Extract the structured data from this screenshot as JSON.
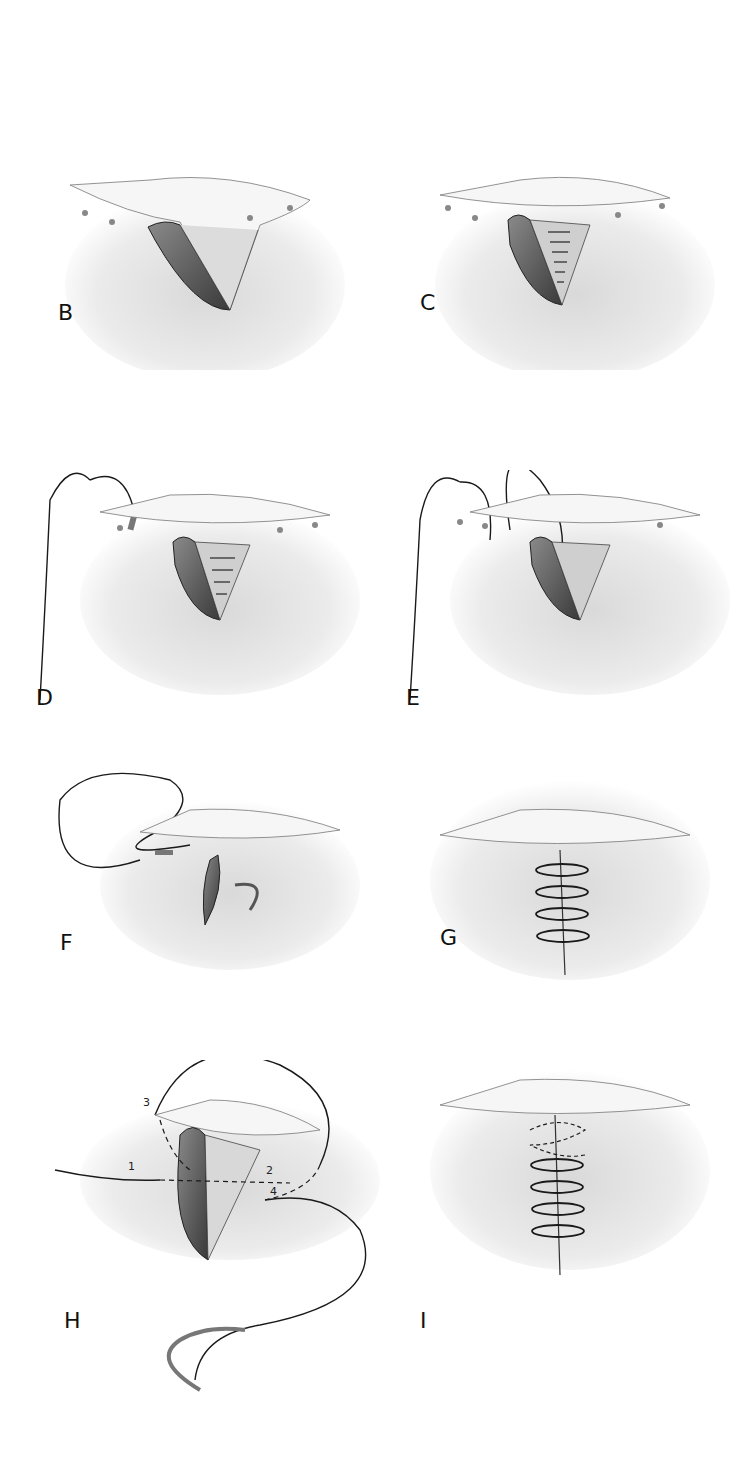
{
  "figure": {
    "panels": [
      {
        "id": "B",
        "label": "B",
        "description": "Wedge-shaped wound with flap, open"
      },
      {
        "id": "C",
        "label": "C",
        "description": "Deep layer closed with interrupted sutures"
      },
      {
        "id": "D",
        "label": "D",
        "description": "Suture needle passed through skin edge"
      },
      {
        "id": "E",
        "label": "E",
        "description": "Suture looped across wound"
      },
      {
        "id": "F",
        "label": "F",
        "description": "Suture tightened, wound edges approximating"
      },
      {
        "id": "G",
        "label": "G",
        "description": "Wound closed with continuous sutures"
      },
      {
        "id": "H",
        "label": "H",
        "description": "Suture path with numbered steps",
        "steps": [
          "1",
          "2",
          "3",
          "4"
        ]
      },
      {
        "id": "I",
        "label": "I",
        "description": "Completed spiral closure"
      }
    ],
    "colors": {
      "ink": "#1a1a1a",
      "shade": "#c8c8c8",
      "tissue": "#6e6e6e"
    }
  }
}
